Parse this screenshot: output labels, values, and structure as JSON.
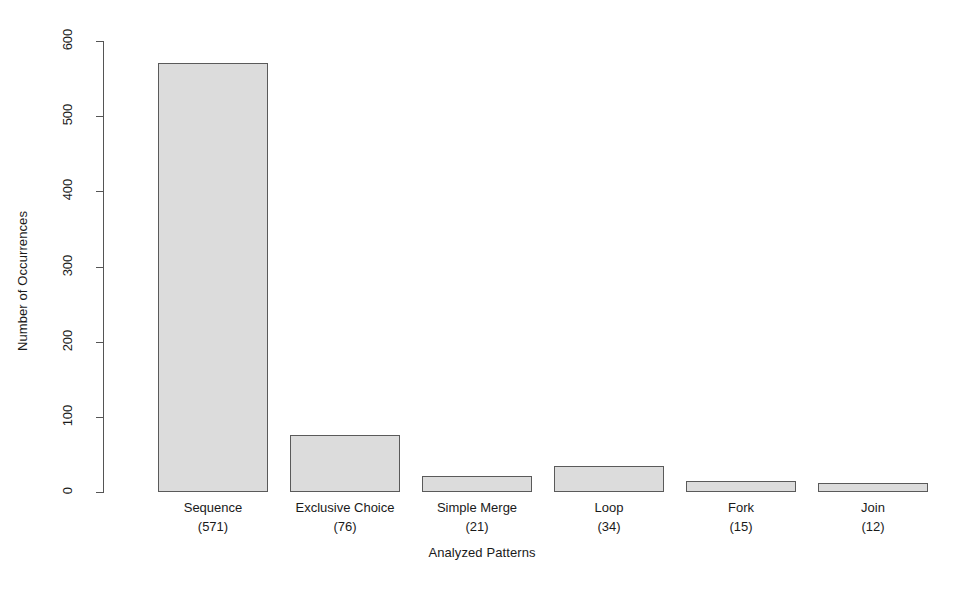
{
  "chart_data": {
    "type": "bar",
    "title": "",
    "xlabel": "Analyzed Patterns",
    "ylabel": "Number of Occurrences",
    "categories": [
      "Sequence",
      "Exclusive Choice",
      "Simple Merge",
      "Loop",
      "Fork",
      "Join"
    ],
    "values": [
      571,
      76,
      21,
      34,
      15,
      12
    ],
    "category_labels": [
      {
        "name": "Sequence",
        "count": "(571)"
      },
      {
        "name": "Exclusive Choice",
        "count": "(76)"
      },
      {
        "name": "Simple Merge",
        "count": "(21)"
      },
      {
        "name": "Loop",
        "count": "(34)"
      },
      {
        "name": "Fork",
        "count": "(15)"
      },
      {
        "name": "Join",
        "count": "(12)"
      }
    ],
    "ylim": [
      0,
      600
    ],
    "yticks": [
      0,
      100,
      200,
      300,
      400,
      500,
      600
    ],
    "ytick_labels": [
      "0",
      "100",
      "200",
      "300",
      "400",
      "500",
      "600"
    ],
    "grid": false,
    "legend": "none",
    "bar_fill_color": "#dcdcdc",
    "bar_border_color": "#5a5a5a",
    "axis_color": "#555555",
    "background_color": "#ffffff"
  }
}
